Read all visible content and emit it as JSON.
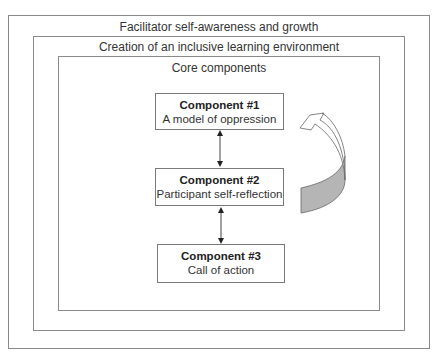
{
  "diagram": {
    "outer_frame": {
      "label": "Facilitator self-awareness and growth"
    },
    "middle_frame": {
      "label": "Creation of an inclusive learning environment"
    },
    "inner_frame": {
      "label": "Core components"
    },
    "components": [
      {
        "title": "Component #1",
        "description": "A model of oppression"
      },
      {
        "title": "Component #2",
        "description": "Participant self-reflection"
      },
      {
        "title": "Component #3",
        "description": "Call of action"
      }
    ],
    "connectors": [
      {
        "from": "Component #1",
        "to": "Component #2",
        "type": "bidirectional-arrow"
      },
      {
        "from": "Component #2",
        "to": "Component #3",
        "type": "bidirectional-arrow"
      }
    ],
    "cycle_arrow": {
      "icon": "curved-return-arrow-icon",
      "fill_color": "#b5b5b5"
    }
  }
}
